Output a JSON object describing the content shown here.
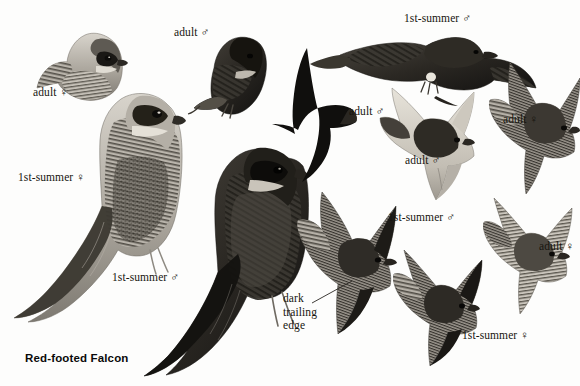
{
  "plate": {
    "title": "Red-footed Falcon",
    "background_color": "#fdfdfc",
    "ink_color": "#17150f",
    "width": 580,
    "height": 386
  },
  "labels": [
    {
      "id": "adult-female-perched",
      "text": "adult ♀",
      "x": 33,
      "y": 92
    },
    {
      "id": "adult-male-perched",
      "text": "adult ♂",
      "x": 174,
      "y": 32
    },
    {
      "id": "first-summer-female-perched",
      "text": "1st-summer ♀",
      "x": 18,
      "y": 177
    },
    {
      "id": "first-summer-male-perched",
      "text": "1st-summer ♂",
      "x": 112,
      "y": 277
    },
    {
      "id": "first-summer-male-top",
      "text": "1st-summer ♂",
      "x": 404,
      "y": 18
    },
    {
      "id": "adult-male-dark-flight",
      "text": "adult ♂",
      "x": 349,
      "y": 111
    },
    {
      "id": "adult-male-underwing",
      "text": "adult ♂",
      "x": 405,
      "y": 160
    },
    {
      "id": "adult-female-upper-right",
      "text": "adult ♀",
      "x": 503,
      "y": 119
    },
    {
      "id": "first-summer-male-lower",
      "text": "1st-summer ♂",
      "x": 388,
      "y": 217
    },
    {
      "id": "adult-female-lower-right",
      "text": "adult ♀",
      "x": 539,
      "y": 246
    },
    {
      "id": "first-summer-female-lower",
      "text": "1st-summer ♀",
      "x": 462,
      "y": 335
    }
  ],
  "annotations": [
    {
      "id": "dark-trailing-edge",
      "lines": [
        "dark",
        "trailing",
        "edge"
      ],
      "x": 283,
      "y": 298,
      "leader": {
        "x1": 312,
        "y1": 303,
        "x2": 352,
        "y2": 281
      }
    }
  ],
  "figures": [
    {
      "id": "adult-female-perched-head",
      "pose": "perched",
      "age_sex": "adult female",
      "plumage": "pale barred"
    },
    {
      "id": "adult-male-perched",
      "pose": "perched",
      "age_sex": "adult male",
      "plumage": "dark slate"
    },
    {
      "id": "first-summer-female-perched",
      "pose": "perched",
      "age_sex": "1st-summer female",
      "plumage": "pale barred"
    },
    {
      "id": "first-summer-male-perched",
      "pose": "perched",
      "age_sex": "1st-summer male",
      "plumage": "dark slate"
    },
    {
      "id": "adult-male-dark-flight",
      "pose": "flight",
      "age_sex": "adult male",
      "plumage": "dark silhouette"
    },
    {
      "id": "first-summer-male-top-prey",
      "pose": "flight",
      "age_sex": "1st-summer male",
      "plumage": "dark, carrying prey"
    },
    {
      "id": "adult-male-underwing",
      "pose": "flight",
      "age_sex": "adult male",
      "plumage": "pale underwing"
    },
    {
      "id": "adult-female-upper-right",
      "pose": "flight",
      "age_sex": "adult female",
      "plumage": "barred upperparts"
    },
    {
      "id": "first-summer-male-lower",
      "pose": "flight",
      "age_sex": "1st-summer male",
      "plumage": "barred underwing"
    },
    {
      "id": "adult-female-lower-right",
      "pose": "flight",
      "age_sex": "adult female",
      "plumage": "barred"
    },
    {
      "id": "first-summer-female-lower",
      "pose": "flight",
      "age_sex": "1st-summer female",
      "plumage": "barred"
    }
  ]
}
